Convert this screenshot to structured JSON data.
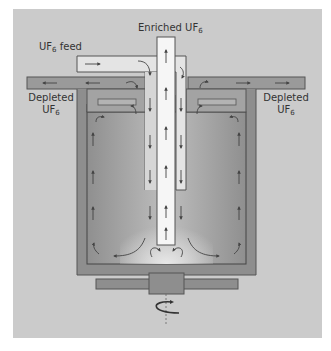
{
  "diagram": {
    "labels": {
      "enriched": {
        "text": "Enriched UF",
        "sub": "6"
      },
      "feed": {
        "text": "UF",
        "sub": "6",
        "suffix": " feed"
      },
      "depleted_left": {
        "line1": "Depleted",
        "line2": "UF",
        "sub": "6"
      },
      "depleted_right": {
        "line1": "Depleted",
        "line2": "UF",
        "sub": "6"
      }
    },
    "components": [
      "feed-pipe",
      "enriched-product-tube",
      "depleted-outlet-left",
      "depleted-outlet-right",
      "rotor-casing",
      "rotor-chamber",
      "base-plate",
      "drive-hub",
      "rotation-axis"
    ],
    "colors": {
      "background": "#cbcbcb",
      "casing": "#8e8e8e",
      "chamber": "#a9a9a9",
      "tube": "#f6f6f6",
      "feed_pipe": "#e4e4e4",
      "depleted_pipe": "#9a9a9a",
      "arrow": "#444444"
    }
  }
}
